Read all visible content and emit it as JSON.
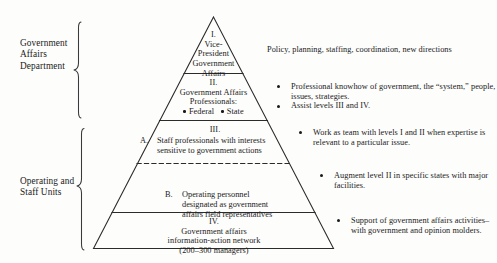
{
  "diagram": {
    "groups": [
      {
        "id": "government-affairs-department",
        "label": "Government\nAffairs\nDepartment"
      },
      {
        "id": "operating-and-staff-units",
        "label": "Operating and\nStaff Units"
      }
    ],
    "levels": [
      {
        "id": "level-1",
        "numeral": "I.",
        "lines": [
          "Vice-",
          "President",
          "Government",
          "Affairs"
        ]
      },
      {
        "id": "level-2",
        "numeral": "II.",
        "lines": [
          "Government Affairs",
          "Professionals:"
        ],
        "items": [
          "Federal",
          "State"
        ]
      },
      {
        "id": "level-3",
        "numeral": "III.",
        "sub_a_letter": "A.",
        "sub_a_lines": [
          "Staff professionals with interests",
          "sensitive to government actions"
        ],
        "sub_b_letter": "B.",
        "sub_b_lines": [
          "Operating personnel",
          "designated as government",
          "affairs field representatives"
        ]
      },
      {
        "id": "level-4",
        "numeral": "IV.",
        "lines": [
          "Government affairs",
          "information-action network",
          "(200–300 managers)"
        ]
      }
    ],
    "annotations": [
      {
        "id": "annotation-level-1",
        "bulleted": false,
        "items": [
          {
            "lines": [
              "Policy, planning, staffing, coordination, new directions"
            ]
          }
        ]
      },
      {
        "id": "annotation-level-2",
        "bulleted": true,
        "items": [
          {
            "lines": [
              "Professional knowhow of government, the “system,”",
              "people, issues, strategies."
            ]
          },
          {
            "lines": [
              "Assist levels III and IV."
            ]
          }
        ]
      },
      {
        "id": "annotation-level-3a",
        "bulleted": true,
        "items": [
          {
            "lines": [
              "Work as team with levels I and II when",
              "expertise is relevant to a particular issue."
            ]
          }
        ]
      },
      {
        "id": "annotation-level-3b",
        "bulleted": true,
        "items": [
          {
            "lines": [
              "Augment level II in specific states",
              "with major facilities."
            ]
          }
        ]
      },
      {
        "id": "annotation-level-4",
        "bulleted": true,
        "items": [
          {
            "lines": [
              "Support of government affairs",
              "activities–with government and",
              "opinion molders."
            ]
          }
        ]
      }
    ],
    "colors": {
      "ink": "#1a1a1a",
      "stroke": "#2b2b2b",
      "paper": "#fdfdfc"
    }
  }
}
